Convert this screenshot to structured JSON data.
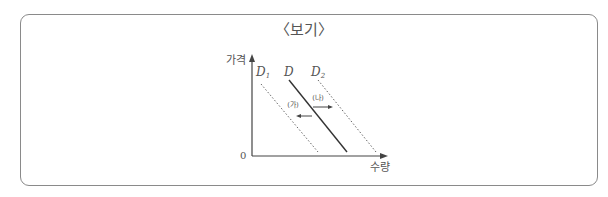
{
  "title": "〈보기〉",
  "diagram": {
    "y_axis_label": "가격",
    "x_axis_label": "수량",
    "origin_label": "0",
    "curves": [
      {
        "name": "D1",
        "label": "D",
        "sub": "1",
        "style": "dotted"
      },
      {
        "name": "D",
        "label": "D",
        "sub": "",
        "style": "solid"
      },
      {
        "name": "D2",
        "label": "D",
        "sub": "2",
        "style": "dotted"
      }
    ],
    "arrows": [
      {
        "label": "(가)",
        "direction": "left"
      },
      {
        "label": "(나)",
        "direction": "right"
      }
    ],
    "colors": {
      "line": "#333333",
      "dotted": "#666666",
      "text": "#555555",
      "border": "#8a8a8a"
    }
  }
}
